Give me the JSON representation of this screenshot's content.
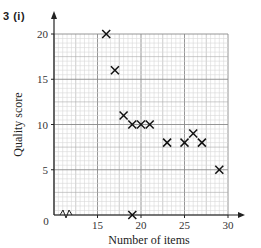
{
  "question_label": "3  (i)",
  "chart_data": {
    "type": "scatter",
    "title": "",
    "xlabel": "Number of items",
    "ylabel": "Quality score",
    "xlim": [
      10,
      30
    ],
    "ylim": [
      0,
      20
    ],
    "x_axis_break": true,
    "x_ticks": [
      0,
      15,
      20,
      25,
      30
    ],
    "y_ticks": [
      0,
      5,
      10,
      15,
      20
    ],
    "grid": true,
    "marker": "x",
    "points": [
      {
        "x": 16,
        "y": 20
      },
      {
        "x": 17,
        "y": 16
      },
      {
        "x": 18,
        "y": 11
      },
      {
        "x": 19,
        "y": 10
      },
      {
        "x": 20,
        "y": 10
      },
      {
        "x": 21,
        "y": 10
      },
      {
        "x": 23,
        "y": 8
      },
      {
        "x": 25,
        "y": 8
      },
      {
        "x": 26,
        "y": 9
      },
      {
        "x": 27,
        "y": 8
      },
      {
        "x": 29,
        "y": 5
      },
      {
        "x": 19,
        "y": 0
      }
    ]
  }
}
